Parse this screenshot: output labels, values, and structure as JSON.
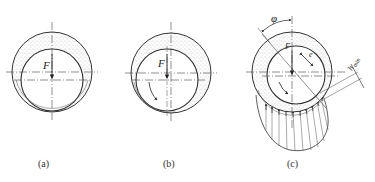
{
  "figure": {
    "panels": [
      {
        "id": "a",
        "caption": "(a)",
        "force_label": "F",
        "state": "journal at rest, in contact at bottom of bearing",
        "bearing_center": [
          52,
          72
        ],
        "bearing_radius": 40,
        "journal_center": [
          52,
          80
        ],
        "journal_radius": 31
      },
      {
        "id": "b",
        "caption": "(b)",
        "force_label": "F",
        "state": "journal starting to rotate, climbs left wall",
        "bearing_center": [
          171,
          73
        ],
        "bearing_radius": 40,
        "journal_center": [
          167,
          80
        ],
        "journal_radius": 31
      },
      {
        "id": "c",
        "caption": "(c)",
        "force_label": "F",
        "angle_label": "φ",
        "eccentricity_label": "e",
        "min_film_label": "h",
        "min_film_subscript": "min",
        "state": "full hydrodynamic film with pressure distribution",
        "bearing_center": [
          292,
          72
        ],
        "bearing_radius": 40,
        "journal_center": [
          296,
          75
        ],
        "journal_radius": 29
      }
    ],
    "colors": {
      "line": "#333333",
      "stipple": "#8a8a8a",
      "background": "#ffffff"
    }
  }
}
